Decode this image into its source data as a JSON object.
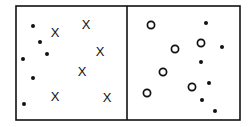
{
  "diagram": {
    "panels": [
      {
        "name": "left",
        "x_markers": [
          {
            "x": 55,
            "y": 32,
            "label": "X"
          },
          {
            "x": 86,
            "y": 24,
            "label": "X"
          },
          {
            "x": 100,
            "y": 51,
            "label": "X"
          },
          {
            "x": 82,
            "y": 71,
            "label": "X"
          },
          {
            "x": 55,
            "y": 96,
            "label": "X"
          },
          {
            "x": 107,
            "y": 97,
            "label": "X"
          }
        ],
        "dots": [
          {
            "x": 33,
            "y": 26
          },
          {
            "x": 40,
            "y": 42
          },
          {
            "x": 47,
            "y": 54
          },
          {
            "x": 23,
            "y": 59
          },
          {
            "x": 33,
            "y": 78
          },
          {
            "x": 24,
            "y": 104
          }
        ]
      },
      {
        "name": "right",
        "circles": [
          {
            "x": 151,
            "y": 25
          },
          {
            "x": 175,
            "y": 49
          },
          {
            "x": 201,
            "y": 43
          },
          {
            "x": 163,
            "y": 72
          },
          {
            "x": 147,
            "y": 93
          },
          {
            "x": 192,
            "y": 87
          }
        ],
        "dots": [
          {
            "x": 206,
            "y": 23
          },
          {
            "x": 222,
            "y": 47
          },
          {
            "x": 201,
            "y": 62
          },
          {
            "x": 209,
            "y": 83
          },
          {
            "x": 202,
            "y": 100
          },
          {
            "x": 215,
            "y": 111
          }
        ]
      }
    ],
    "frame": {
      "left": 16,
      "top": 6,
      "right": 240,
      "bottom": 120,
      "divider": 127
    }
  }
}
